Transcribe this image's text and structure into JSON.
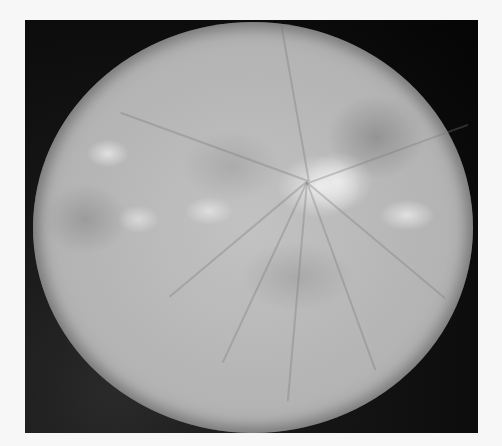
{
  "image": {
    "subject": "retinal fundus photograph",
    "color_mode": "grayscale",
    "colors": {
      "background": "#f7f7f7",
      "frame": "#050505",
      "fundus_base": "#b4b4b4",
      "bright_lesions": "#ececec"
    }
  }
}
